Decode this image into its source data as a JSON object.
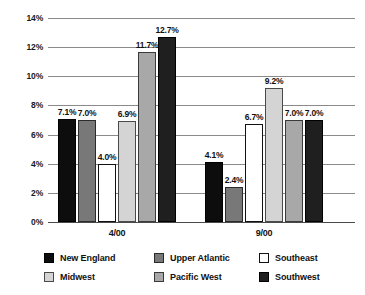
{
  "chart_data": {
    "type": "bar",
    "title": "",
    "subtitle": "",
    "xlabel": "",
    "ylabel": "",
    "grid": true,
    "legend_position": "bottom",
    "categories": [
      "4/00",
      "9/00"
    ],
    "ylim": [
      0,
      14
    ],
    "ytick_labels": [
      "0%",
      "2%",
      "4%",
      "6%",
      "8%",
      "10%",
      "12%",
      "14%"
    ],
    "ytick_values": [
      0,
      2,
      4,
      6,
      8,
      10,
      12,
      14
    ],
    "value_suffix": "%",
    "series": [
      {
        "name": "New England",
        "color": "#0d0d0d",
        "border": "#000000",
        "values": [
          7.1,
          7.0
        ],
        "labels": [
          "7.1%",
          "4.1%"
        ]
      },
      {
        "name": "Upper Atlantic",
        "color": "#787878",
        "border": "#2b2b2b",
        "values": [
          7.0,
          2.4
        ],
        "labels": [
          "7.0%",
          "2.4%"
        ]
      },
      {
        "name": "Southeast",
        "color": "#ffffff",
        "border": "#111111",
        "values": [
          4.0,
          6.7
        ],
        "labels": [
          "4.0%",
          "6.7%"
        ]
      },
      {
        "name": "Midwest",
        "color": "#d4d4d4",
        "border": "#4a4a4a",
        "values": [
          6.9,
          9.2
        ],
        "labels": [
          "6.9%",
          "9.2%"
        ]
      },
      {
        "name": "Pacific West",
        "color": "#a8a8a8",
        "border": "#3a3a3a",
        "values": [
          11.7,
          7.0
        ],
        "labels": [
          "11.7%",
          "7.0%"
        ]
      },
      {
        "name": "Southwest",
        "color": "#1f1f1f",
        "border": "#000000",
        "values": [
          12.7,
          7.0
        ],
        "labels": [
          "12.7%",
          "7.0%"
        ]
      }
    ],
    "group_values": {
      "4/00": [
        7.1,
        7.0,
        4.0,
        6.9,
        11.7,
        12.7
      ],
      "9/00": [
        4.1,
        2.4,
        6.7,
        9.2,
        7.0,
        7.0
      ]
    },
    "group_labels": {
      "4/00": [
        "7.1%",
        "7.0%",
        "4.0%",
        "6.9%",
        "11.7%",
        "12.7%"
      ],
      "9/00": [
        "4.1%",
        "2.4%",
        "6.7%",
        "9.2%",
        "7.0%",
        "7.0%"
      ]
    }
  },
  "legend": {
    "entries": [
      {
        "label": "New England",
        "color": "#0d0d0d",
        "border": "#000000"
      },
      {
        "label": "Upper Atlantic",
        "color": "#787878",
        "border": "#2b2b2b"
      },
      {
        "label": "Southeast",
        "color": "#ffffff",
        "border": "#111111"
      },
      {
        "label": "Midwest",
        "color": "#d4d4d4",
        "border": "#4a4a4a"
      },
      {
        "label": "Pacific West",
        "color": "#a8a8a8",
        "border": "#3a3a3a"
      },
      {
        "label": "Southwest",
        "color": "#1f1f1f",
        "border": "#000000"
      }
    ]
  }
}
